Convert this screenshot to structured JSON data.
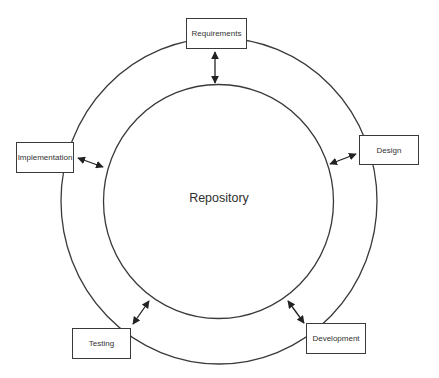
{
  "diagram": {
    "center": {
      "label": "Repository"
    },
    "nodes": [
      {
        "id": "requirements",
        "label": "Requirements"
      },
      {
        "id": "design",
        "label": "Design"
      },
      {
        "id": "development",
        "label": "Development"
      },
      {
        "id": "testing",
        "label": "Testing"
      },
      {
        "id": "implementation",
        "label": "Implementation"
      }
    ],
    "edges": [
      {
        "from": "requirements",
        "to": "repository",
        "type": "bidirectional"
      },
      {
        "from": "design",
        "to": "repository",
        "type": "bidirectional"
      },
      {
        "from": "development",
        "to": "repository",
        "type": "bidirectional"
      },
      {
        "from": "testing",
        "to": "repository",
        "type": "bidirectional"
      },
      {
        "from": "implementation",
        "to": "repository",
        "type": "bidirectional"
      }
    ],
    "colors": {
      "stroke": "#3a3a3a",
      "background": "#ffffff",
      "text": "#333333"
    }
  }
}
